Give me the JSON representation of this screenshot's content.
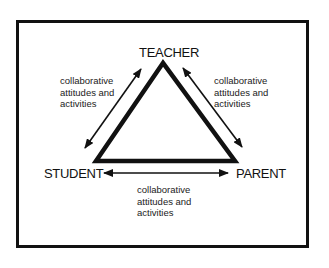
{
  "diagram": {
    "nodes": {
      "teacher": "TEACHER",
      "student": "STUDENT",
      "parent": "PARENT"
    },
    "edges": [
      {
        "from": "teacher",
        "to": "student",
        "label": "collaborative\nattitudes and\nactivities",
        "bidirectional": true
      },
      {
        "from": "teacher",
        "to": "parent",
        "label": "collaborative\nattitudes and\nactivities",
        "bidirectional": true
      },
      {
        "from": "student",
        "to": "parent",
        "label": "collaborative\nattitudes and\nactivities",
        "bidirectional": true
      }
    ],
    "colors": {
      "line": "#111111",
      "background": "#ffffff"
    }
  }
}
